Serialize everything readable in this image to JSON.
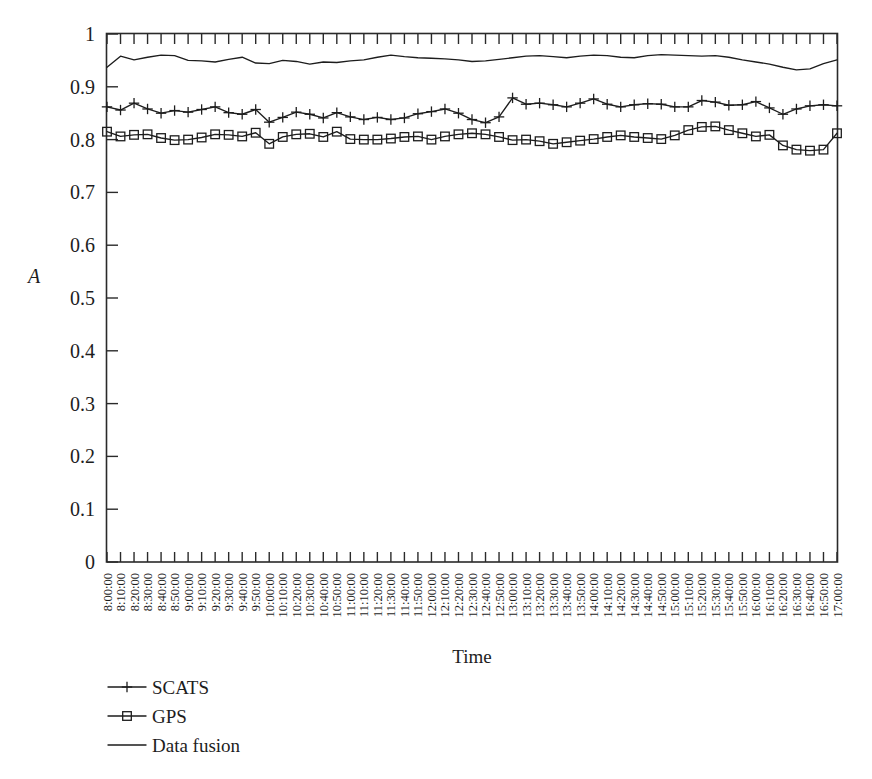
{
  "chart_data": {
    "type": "line",
    "title": "",
    "xlabel": "Time",
    "ylabel": "A",
    "ylim": [
      0,
      1
    ],
    "ytick_labels": [
      "0",
      "0.1",
      "0.2",
      "0.3",
      "0.4",
      "0.5",
      "0.6",
      "0.7",
      "0.8",
      "0.9",
      "1"
    ],
    "ytick_values": [
      0,
      0.1,
      0.2,
      0.3,
      0.4,
      0.5,
      0.6,
      0.7,
      0.8,
      0.9,
      1
    ],
    "grid": false,
    "legend_position": "below-left",
    "categories": [
      "8:00:00",
      "8:10:00",
      "8:20:00",
      "8:30:00",
      "8:40:00",
      "8:50:00",
      "9:00:00",
      "9:10:00",
      "9:20:00",
      "9:30:00",
      "9:40:00",
      "9:50:00",
      "10:00:00",
      "10:10:00",
      "10:20:00",
      "10:30:00",
      "10:40:00",
      "10:50:00",
      "11:00:00",
      "11:10:00",
      "11:20:00",
      "11:30:00",
      "11:40:00",
      "11:50:00",
      "12:00:00",
      "12:10:00",
      "12:20:00",
      "12:30:00",
      "12:40:00",
      "12:50:00",
      "13:00:00",
      "13:10:00",
      "13:20:00",
      "13:30:00",
      "13:40:00",
      "13:50:00",
      "14:00:00",
      "14:10:00",
      "14:20:00",
      "14:30:00",
      "14:40:00",
      "14:50:00",
      "15:00:00",
      "15:10:00",
      "15:20:00",
      "15:30:00",
      "15:40:00",
      "15:50:00",
      "16:00:00",
      "16:10:00",
      "16:20:00",
      "16:30:00",
      "16:40:00",
      "16:50:00",
      "17:00:00"
    ],
    "series": [
      {
        "name": "SCATS",
        "marker": "plus",
        "values": [
          0.862,
          0.856,
          0.869,
          0.858,
          0.85,
          0.855,
          0.852,
          0.857,
          0.862,
          0.851,
          0.848,
          0.857,
          0.833,
          0.842,
          0.852,
          0.848,
          0.841,
          0.851,
          0.843,
          0.838,
          0.842,
          0.838,
          0.841,
          0.849,
          0.853,
          0.858,
          0.85,
          0.838,
          0.832,
          0.843,
          0.879,
          0.867,
          0.869,
          0.866,
          0.862,
          0.869,
          0.877,
          0.867,
          0.862,
          0.866,
          0.868,
          0.867,
          0.862,
          0.862,
          0.874,
          0.871,
          0.865,
          0.866,
          0.872,
          0.86,
          0.848,
          0.858,
          0.864,
          0.866,
          0.864
        ]
      },
      {
        "name": "GPS",
        "marker": "square",
        "values": [
          0.815,
          0.806,
          0.809,
          0.81,
          0.803,
          0.799,
          0.8,
          0.804,
          0.81,
          0.809,
          0.806,
          0.813,
          0.792,
          0.805,
          0.81,
          0.811,
          0.805,
          0.815,
          0.801,
          0.8,
          0.8,
          0.802,
          0.805,
          0.806,
          0.8,
          0.806,
          0.81,
          0.812,
          0.81,
          0.805,
          0.799,
          0.8,
          0.797,
          0.792,
          0.795,
          0.798,
          0.801,
          0.805,
          0.808,
          0.805,
          0.803,
          0.801,
          0.808,
          0.818,
          0.824,
          0.825,
          0.818,
          0.812,
          0.806,
          0.809,
          0.789,
          0.781,
          0.779,
          0.781,
          0.812
        ]
      },
      {
        "name": "Data fusion",
        "marker": "none",
        "values": [
          0.937,
          0.958,
          0.951,
          0.956,
          0.96,
          0.959,
          0.95,
          0.949,
          0.947,
          0.952,
          0.956,
          0.945,
          0.944,
          0.95,
          0.948,
          0.943,
          0.947,
          0.946,
          0.949,
          0.951,
          0.956,
          0.96,
          0.957,
          0.955,
          0.954,
          0.953,
          0.951,
          0.948,
          0.949,
          0.952,
          0.955,
          0.958,
          0.959,
          0.957,
          0.955,
          0.958,
          0.96,
          0.959,
          0.956,
          0.955,
          0.959,
          0.961,
          0.96,
          0.959,
          0.958,
          0.959,
          0.956,
          0.951,
          0.947,
          0.943,
          0.937,
          0.932,
          0.934,
          0.944,
          0.951
        ]
      }
    ]
  },
  "legend": {
    "items": [
      {
        "label": "SCATS",
        "marker": "plus"
      },
      {
        "label": "GPS",
        "marker": "square"
      },
      {
        "label": "Data fusion",
        "marker": "none"
      }
    ]
  },
  "colors": {
    "line": "#1d1d1d",
    "axis": "#2a2a2a",
    "background": "#ffffff"
  }
}
